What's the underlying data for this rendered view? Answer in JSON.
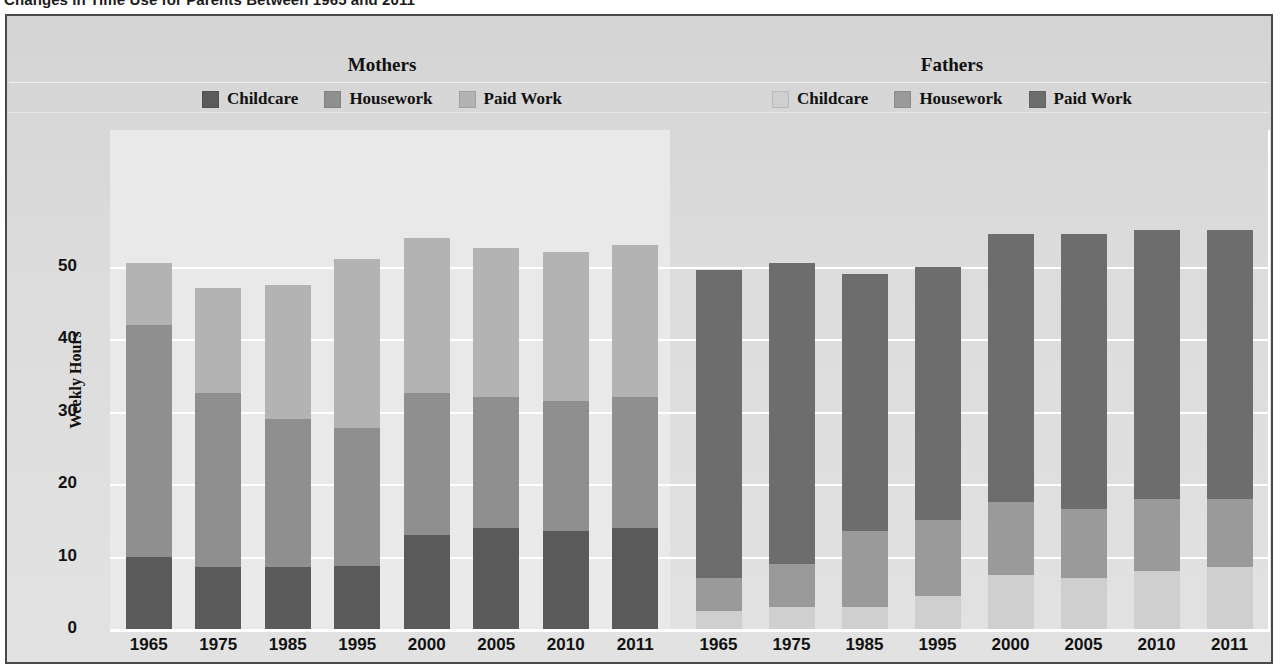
{
  "title": "Changes in Time Use for Parents Between 1965 and 2011",
  "axis": {
    "ylabel": "Weekly Hours",
    "yticks": [
      "0",
      "10",
      "20",
      "30",
      "40",
      "50"
    ]
  },
  "groups": {
    "mothers": {
      "header": "Mothers",
      "legend": [
        {
          "label": "Childcare",
          "color": "#5a5a5a"
        },
        {
          "label": "Housework",
          "color": "#8f8f8f"
        },
        {
          "label": "Paid Work",
          "color": "#b3b3b3"
        }
      ]
    },
    "fathers": {
      "header": "Fathers",
      "legend": [
        {
          "label": "Childcare",
          "color": "#cfcfcf"
        },
        {
          "label": "Housework",
          "color": "#9a9a9a"
        },
        {
          "label": "Paid Work",
          "color": "#6d6d6d"
        }
      ]
    }
  },
  "colors": {
    "frame_border": "#4a4a4a",
    "figure_bg": "#d9d9d9",
    "plot_panel_left": "#e9e9e9",
    "gridline": "#ffffff",
    "mothers_childcare": "#5a5a5a",
    "mothers_housework": "#8f8f8f",
    "mothers_paidwork": "#b3b3b3",
    "fathers_childcare": "#cfcfcf",
    "fathers_housework": "#9a9a9a",
    "fathers_paidwork": "#6d6d6d"
  },
  "chart_data": {
    "type": "bar",
    "subtype": "stacked",
    "title": "Changes in Time Use for Parents Between 1965 and 2011",
    "xlabel": "",
    "ylabel": "Weekly Hours",
    "ylim": [
      0,
      57
    ],
    "yticks": [
      0,
      10,
      20,
      30,
      40,
      50
    ],
    "grid": true,
    "legend_position": "top",
    "panels": [
      {
        "name": "Mothers",
        "categories": [
          "1965",
          "1975",
          "1985",
          "1995",
          "2000",
          "2005",
          "2010",
          "2011"
        ],
        "stack_order_bottom_to_top": [
          "Childcare",
          "Housework",
          "Paid Work"
        ],
        "series": [
          {
            "name": "Childcare",
            "color": "#5a5a5a",
            "values": [
              10.0,
              8.5,
              8.5,
              8.7,
              13.0,
              14.0,
              13.5,
              14.0
            ]
          },
          {
            "name": "Housework",
            "color": "#8f8f8f",
            "values": [
              32.0,
              24.0,
              20.5,
              19.0,
              19.5,
              18.0,
              18.0,
              18.0
            ]
          },
          {
            "name": "Paid Work",
            "color": "#b3b3b3",
            "values": [
              8.5,
              14.5,
              18.5,
              23.3,
              21.5,
              20.5,
              20.5,
              21.0
            ]
          }
        ],
        "totals": [
          50.5,
          47.0,
          47.5,
          51.0,
          54.0,
          52.5,
          52.0,
          53.0
        ]
      },
      {
        "name": "Fathers",
        "categories": [
          "1965",
          "1975",
          "1985",
          "1995",
          "2000",
          "2005",
          "2010",
          "2011"
        ],
        "stack_order_bottom_to_top": [
          "Childcare",
          "Housework",
          "Paid Work"
        ],
        "series": [
          {
            "name": "Childcare",
            "color": "#cfcfcf",
            "values": [
              2.5,
              3.0,
              3.0,
              4.5,
              7.5,
              7.0,
              8.0,
              8.5
            ]
          },
          {
            "name": "Housework",
            "color": "#9a9a9a",
            "values": [
              4.5,
              6.0,
              10.5,
              10.5,
              10.0,
              9.5,
              10.0,
              9.5
            ]
          },
          {
            "name": "Paid Work",
            "color": "#6d6d6d",
            "values": [
              42.5,
              41.5,
              35.5,
              35.0,
              37.0,
              38.0,
              37.0,
              37.0
            ]
          }
        ],
        "totals": [
          49.5,
          50.5,
          49.0,
          50.0,
          54.5,
          54.5,
          55.0,
          55.0
        ]
      }
    ]
  }
}
